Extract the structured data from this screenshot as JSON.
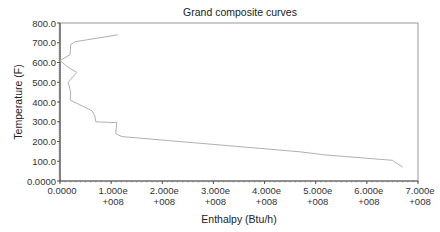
{
  "chart_data": {
    "type": "line",
    "title": "Grand composite curves",
    "xlabel": "Enthalpy (Btu/h)",
    "ylabel": "Temperature (F)",
    "xlim": [
      0,
      700000000
    ],
    "ylim": [
      0,
      800
    ],
    "grid": false,
    "legend": null,
    "x_ticks": [
      {
        "value": 0,
        "line1": "0.0000",
        "line2": ""
      },
      {
        "value": 100000000,
        "line1": "1.000e",
        "line2": "+008"
      },
      {
        "value": 200000000,
        "line1": "2.000e",
        "line2": "+008"
      },
      {
        "value": 300000000,
        "line1": "3.000e",
        "line2": "+008"
      },
      {
        "value": 400000000,
        "line1": "4.000e",
        "line2": "+008"
      },
      {
        "value": 500000000,
        "line1": "5.000e",
        "line2": "+008"
      },
      {
        "value": 600000000,
        "line1": "6.000e",
        "line2": "+008"
      },
      {
        "value": 700000000,
        "line1": "7.000e",
        "line2": "+008"
      }
    ],
    "y_ticks": [
      {
        "value": 0,
        "label": "0.0000"
      },
      {
        "value": 100,
        "label": "100.0"
      },
      {
        "value": 200,
        "label": "200.0"
      },
      {
        "value": 300,
        "label": "300.0"
      },
      {
        "value": 400,
        "label": "400.0"
      },
      {
        "value": 500,
        "label": "500.0"
      },
      {
        "value": 600,
        "label": "600.0"
      },
      {
        "value": 700,
        "label": "700.0"
      },
      {
        "value": 800,
        "label": "800.0"
      }
    ],
    "series": [
      {
        "name": "Grand composite curve",
        "color": "#b0b0b0",
        "points": [
          [
            113000000,
            740
          ],
          [
            29000000,
            705
          ],
          [
            21000000,
            690
          ],
          [
            20000000,
            640
          ],
          [
            0,
            610
          ],
          [
            16000000,
            575
          ],
          [
            33000000,
            550
          ],
          [
            16000000,
            500
          ],
          [
            21000000,
            450
          ],
          [
            20000000,
            410
          ],
          [
            63000000,
            355
          ],
          [
            68000000,
            330
          ],
          [
            70000000,
            300
          ],
          [
            111000000,
            295
          ],
          [
            109000000,
            240
          ],
          [
            121000000,
            225
          ],
          [
            469000000,
            148
          ],
          [
            518000000,
            132
          ],
          [
            650000000,
            105
          ],
          [
            670000000,
            70
          ]
        ]
      }
    ]
  }
}
